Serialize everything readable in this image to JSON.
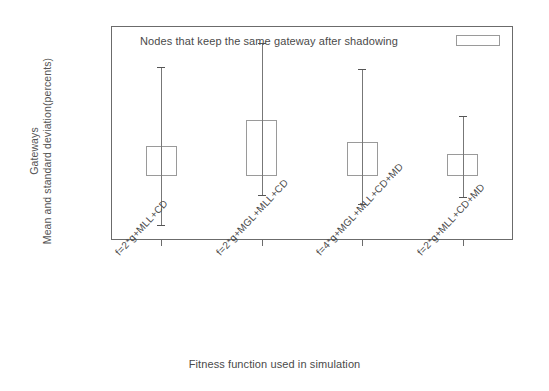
{
  "chart_data": {
    "type": "bar",
    "title": "",
    "xlabel": "Fitness function used in simulation",
    "ylabel": "Gateways\nMean and standard deviation(percents)",
    "ylabel_lines": [
      "Gateways",
      "Mean and standard deviation(percents)"
    ],
    "legend": {
      "entries": [
        "Nodes that keep the same gateway after shadowing"
      ],
      "position": "top-inside",
      "key_style": "open-rectangle"
    },
    "grid": true,
    "ylim": [
      -15,
      35
    ],
    "yticks": [
      35,
      30,
      25,
      20,
      15,
      10,
      5,
      0,
      -5,
      -10,
      -15
    ],
    "ytick_labels": [
      "35",
      "30",
      "25",
      "20",
      "15",
      "10",
      "5",
      "0",
      "-5",
      "-10",
      "-15"
    ],
    "categories": [
      "f=2*g+MLL+CD",
      "f=2*g+MGL+MLL+CD",
      "f=4*g+MGL+MLL+CD+MD",
      "f=2*g+MLL+CD+MD"
    ],
    "series": [
      {
        "name": "Nodes that keep the same gateway after shadowing",
        "values": [
          7,
          13,
          8,
          5
        ],
        "err_low": [
          -11.5,
          -4.5,
          -6.5,
          -5
        ],
        "err_high": [
          25.5,
          31,
          25,
          14
        ]
      }
    ]
  },
  "axis": {
    "y_tick_0": "35",
    "y_tick_1": "30",
    "y_tick_2": "25",
    "y_tick_3": "20",
    "y_tick_4": "15",
    "y_tick_5": "10",
    "y_tick_6": "5",
    "y_tick_7": "0",
    "y_tick_8": "-5",
    "y_tick_9": "-10",
    "y_tick_10": "-15"
  },
  "colors": {
    "frame": "#6b6b6b",
    "grid": "#c9c9c9",
    "box": "#9a9a9a",
    "errorbar": "#777777",
    "text": "#4a4a4a",
    "background": "#ffffff"
  }
}
